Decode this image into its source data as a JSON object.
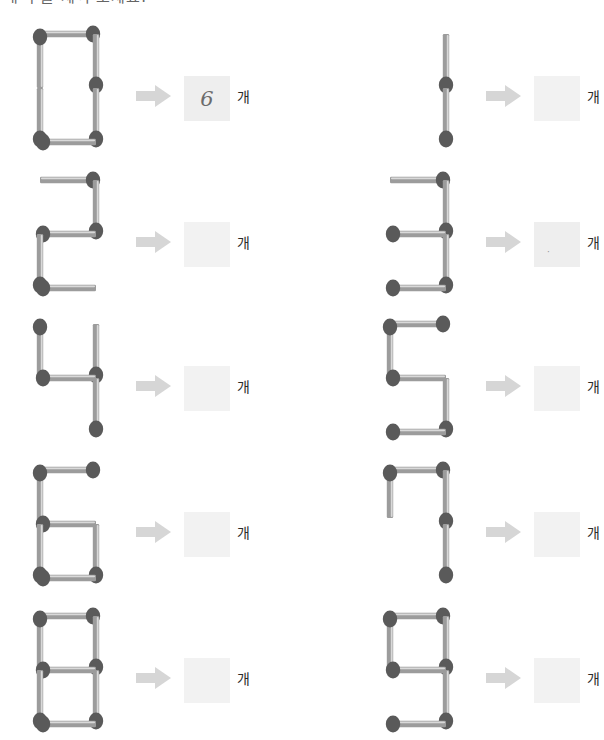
{
  "page": {
    "header_text": "매 수를 세어 보세요.",
    "background_color": "#ffffff",
    "width": 596,
    "height": 740
  },
  "style": {
    "match_stick_color": "#9c9c9c",
    "match_stick_highlight": "#d9d9d9",
    "match_head_color": "#5a5a5a",
    "arrow_color": "#d6d6d6",
    "answer_box_color": "#f2f2f2",
    "answer_ink_color": "#6b6b6b"
  },
  "icons": {
    "arrow": "right-arrow-icon",
    "matchstick": "matchstick-icon"
  },
  "problems": [
    {
      "id": "p0",
      "digit": "0",
      "match_count": 6,
      "answer_value": "6",
      "answer_filled": true,
      "unit_label": "개",
      "arrow_label": "→",
      "col": 0,
      "row": 0
    },
    {
      "id": "p1",
      "digit": "1",
      "match_count": 2,
      "answer_value": "",
      "answer_filled": false,
      "unit_label": "개",
      "arrow_label": "→",
      "col": 1,
      "row": 0
    },
    {
      "id": "p2",
      "digit": "2",
      "match_count": 5,
      "answer_value": "",
      "answer_filled": false,
      "unit_label": "개",
      "arrow_label": "→",
      "col": 0,
      "row": 1
    },
    {
      "id": "p3",
      "digit": "3",
      "match_count": 5,
      "answer_value": "·",
      "answer_filled": true,
      "unit_label": "개",
      "arrow_label": "→",
      "col": 1,
      "row": 1
    },
    {
      "id": "p4",
      "digit": "4",
      "match_count": 4,
      "answer_value": "",
      "answer_filled": false,
      "unit_label": "개",
      "arrow_label": "→",
      "col": 0,
      "row": 2
    },
    {
      "id": "p5",
      "digit": "5",
      "match_count": 5,
      "answer_value": "",
      "answer_filled": false,
      "unit_label": "개",
      "arrow_label": "→",
      "col": 1,
      "row": 2
    },
    {
      "id": "p6",
      "digit": "6",
      "match_count": 6,
      "answer_value": "",
      "answer_filled": false,
      "unit_label": "개",
      "arrow_label": "→",
      "col": 0,
      "row": 3
    },
    {
      "id": "p7",
      "digit": "7",
      "match_count": 4,
      "answer_value": "",
      "answer_filled": false,
      "unit_label": "개",
      "arrow_label": "→",
      "col": 1,
      "row": 3
    },
    {
      "id": "p8",
      "digit": "8",
      "match_count": 7,
      "answer_value": "",
      "answer_filled": false,
      "unit_label": "개",
      "arrow_label": "→",
      "col": 0,
      "row": 4
    },
    {
      "id": "p9",
      "digit": "9",
      "match_count": 6,
      "answer_value": "",
      "answer_filled": false,
      "unit_label": "개",
      "arrow_label": "→",
      "col": 1,
      "row": 4
    }
  ],
  "layout": {
    "col_x": [
      18,
      368
    ],
    "row_y": [
      22,
      168,
      312,
      458,
      604
    ]
  },
  "segments": {
    "0": [
      "top",
      "tl",
      "tr",
      "bl",
      "br",
      "bottom"
    ],
    "1": [
      "tr",
      "br"
    ],
    "2": [
      "top",
      "tr",
      "middle",
      "bl",
      "bottom"
    ],
    "3": [
      "top",
      "tr",
      "middle",
      "br",
      "bottom"
    ],
    "4": [
      "tl",
      "tr",
      "middle",
      "br"
    ],
    "5": [
      "top",
      "tl",
      "middle",
      "br",
      "bottom"
    ],
    "6": [
      "top",
      "tl",
      "middle",
      "bl",
      "br",
      "bottom"
    ],
    "7": [
      "top",
      "tl_stub",
      "tr",
      "br"
    ],
    "8": [
      "top",
      "tl",
      "tr",
      "middle",
      "bl",
      "br",
      "bottom"
    ],
    "9": [
      "top",
      "tl",
      "tr",
      "middle",
      "br",
      "bottom"
    ]
  }
}
